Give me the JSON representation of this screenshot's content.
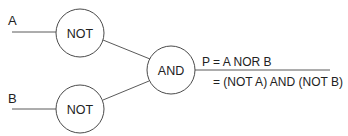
{
  "diagram": {
    "type": "logic-gate-circuit",
    "inputs": [
      {
        "id": "A",
        "label": "A"
      },
      {
        "id": "B",
        "label": "B"
      }
    ],
    "gates": [
      {
        "id": "not1",
        "label": "NOT",
        "input": "A"
      },
      {
        "id": "not2",
        "label": "NOT",
        "input": "B"
      },
      {
        "id": "and1",
        "label": "AND",
        "inputs": [
          "not1",
          "not2"
        ]
      }
    ],
    "output": {
      "equation_line1": "P = A NOR B",
      "equation_line2": "= (NOT A) AND (NOT B)"
    },
    "colors": {
      "line": "#5a5a5a",
      "text": "#222222",
      "background": "#ffffff"
    }
  }
}
